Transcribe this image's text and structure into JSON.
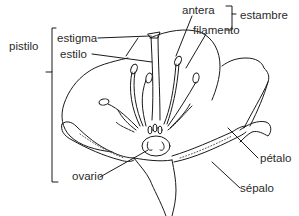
{
  "diagram": {
    "labels": {
      "pistilo": "pistilo",
      "estigma": "estigma",
      "estilo": "estilo",
      "ovario": "ovario",
      "antera": "antera",
      "filamento": "filamento",
      "estambre": "estambre",
      "petalo": "pétalo",
      "sepalo": "sépalo"
    },
    "groups": {
      "pistilo": [
        "estigma",
        "estilo",
        "ovario"
      ],
      "estambre": [
        "antera",
        "filamento"
      ]
    },
    "colors": {
      "line": "#1a1a1a",
      "text": "#2a2a2a",
      "background": "#ffffff"
    }
  }
}
